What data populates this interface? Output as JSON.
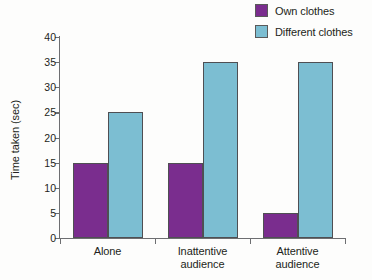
{
  "chart_data": {
    "type": "bar",
    "title": "",
    "subtitle": "",
    "xlabel": "",
    "ylabel": "Time taken (sec)",
    "categories": [
      "Alone",
      "Inattentive audience",
      "Attentive audience"
    ],
    "category_lines": [
      [
        "Alone"
      ],
      [
        "Inattentive",
        "audience"
      ],
      [
        "Attentive",
        "audience"
      ]
    ],
    "series": [
      {
        "name": "Own clothes",
        "color": "#7a2d8e",
        "values": [
          15,
          15,
          5
        ]
      },
      {
        "name": "Different clothes",
        "color": "#7cbed2",
        "values": [
          25,
          35,
          35
        ]
      }
    ],
    "ylim": [
      0,
      40
    ],
    "yticks": [
      0,
      5,
      10,
      15,
      20,
      25,
      30,
      35,
      40
    ],
    "ytick_labels": [
      "0",
      "5",
      "10",
      "15",
      "20",
      "25",
      "30",
      "35",
      "40"
    ],
    "grid": false,
    "legend_position": "top-right",
    "axis_color": "#6d6e71",
    "text_color": "#231f20",
    "background": "#fdfdfc"
  },
  "legend": {
    "items": [
      {
        "label": "Own clothes",
        "color": "#7a2d8e"
      },
      {
        "label": "Different clothes",
        "color": "#7cbed2"
      }
    ]
  }
}
